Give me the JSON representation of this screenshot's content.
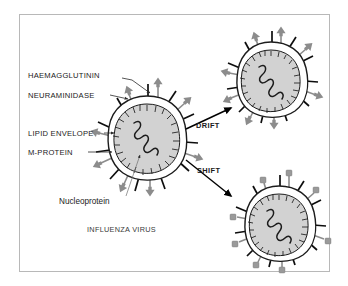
{
  "figure": {
    "kind": "biological-diagram",
    "caption": "INFLUENZA VIRUS",
    "frame": {
      "border_color": "#b8b8b8",
      "background": "#ffffff"
    }
  },
  "palette": {
    "outline": "#1c1c1c",
    "capsid_fill": "#d2d2d2",
    "envelope_fill": "#ffffff",
    "spike_black": "#0d0d0d",
    "spike_gray": "#8c8c8c",
    "text": "#1a1a1a",
    "leader": "#2a2a2a",
    "page_background": "#ffffff"
  },
  "labels": {
    "haemagglutinin": "HAEMAGGLUTININ",
    "neuraminidase": "NEURAMINIDASE",
    "lipid_envelope": "LIPID ENVELOPE",
    "m_protein": "M-PROTEIN",
    "nucleoprotein": "Nucleoprotein",
    "influenza_virus": "INFLUENZA VIRUS"
  },
  "pathways": [
    {
      "id": "drift",
      "label": "DRIFT",
      "direction": "up-right",
      "description": "minor antigenic change"
    },
    {
      "id": "shift",
      "label": "SHIFT",
      "direction": "down-right",
      "description": "major antigenic change"
    }
  ],
  "particles": [
    {
      "id": "parent-virus",
      "name": "influenza-virus-particle",
      "spike_types": [
        "black-rod",
        "gray-arrow"
      ],
      "has_nucleoprotein": true
    },
    {
      "id": "drift-virus",
      "name": "drift-variant-particle",
      "spike_types": [
        "black-rod",
        "gray-arrow"
      ],
      "has_nucleoprotein": true
    },
    {
      "id": "shift-virus",
      "name": "shift-variant-particle",
      "spike_types": [
        "black-rod",
        "gray-knob"
      ],
      "has_nucleoprotein": true
    }
  ]
}
